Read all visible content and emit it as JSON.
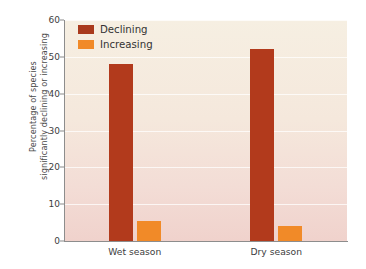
{
  "chart_data": {
    "type": "bar",
    "title": "",
    "xlabel": "",
    "ylabel": "Percentage of species significantly declining or increasing",
    "ylabel_line1": "Percentage of species",
    "ylabel_line2": "significantly declining or increasing",
    "categories": [
      "Wet season",
      "Dry season"
    ],
    "series": [
      {
        "name": "Declining",
        "color": "#b23a1c",
        "values": [
          48,
          52
        ]
      },
      {
        "name": "Increasing",
        "color": "#f18a28",
        "values": [
          5.5,
          4
        ]
      }
    ],
    "ylim": [
      0,
      60
    ],
    "yticks": [
      0,
      10,
      20,
      30,
      40,
      50,
      60
    ],
    "ytick_labels": [
      "0",
      "10",
      "20",
      "30",
      "40",
      "50",
      "60"
    ],
    "grid": true,
    "legend_position": "top-left-inside"
  },
  "legend": {
    "items": [
      {
        "label": "Declining",
        "color": "#b23a1c"
      },
      {
        "label": "Increasing",
        "color": "#f18a28"
      }
    ]
  },
  "colors": {
    "declining": "#b23a1c",
    "increasing": "#f18a28",
    "plot_background_top": "#f6efe2",
    "plot_background_bottom": "#f0d2cc",
    "axis": "#8d8d8d",
    "text": "#3d3d3d"
  }
}
